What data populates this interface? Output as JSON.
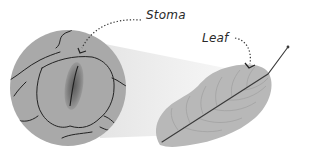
{
  "diagram": {
    "type": "biology-illustration",
    "labels": {
      "stoma": "Stoma",
      "leaf": "Leaf"
    },
    "elements": {
      "magnified_view": "circle-magnified-stoma",
      "leaf": "leaf-with-veins",
      "beam": "magnification-cone"
    },
    "colors": {
      "circle_fill": "#a9a9a9",
      "leaf_fill": "#b8b8b8",
      "line": "#2b2b2b",
      "beam": "#ececec",
      "stoma_dark": "#6e6e6e"
    }
  }
}
